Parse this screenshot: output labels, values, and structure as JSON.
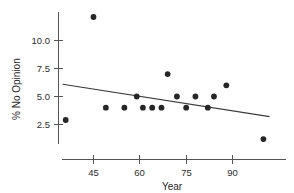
{
  "chart_data": {
    "type": "scatter",
    "title": "",
    "xlabel": "Year",
    "ylabel": "% No Opinion",
    "xlim": [
      34,
      104
    ],
    "ylim": [
      0.6,
      12.6
    ],
    "xticks": [
      45,
      60,
      75,
      90
    ],
    "xtick_labels": [
      "45",
      "60",
      "75",
      "90"
    ],
    "yticks": [
      2.5,
      5.0,
      7.5,
      10.0
    ],
    "ytick_labels": [
      "2.5",
      "5.0",
      "7.5",
      "10.0"
    ],
    "grid": false,
    "legend": null,
    "point_color": "#262626",
    "line_color": "#3a3a3a",
    "axis_color": "#555555",
    "x": [
      36,
      45,
      49,
      55,
      59,
      61,
      64,
      67,
      69,
      72,
      75,
      78,
      82,
      84,
      88,
      100
    ],
    "y": [
      2.9,
      12.1,
      4.0,
      4.0,
      5.0,
      4.0,
      4.0,
      4.0,
      7.0,
      5.0,
      4.0,
      5.0,
      4.0,
      5.0,
      6.0,
      1.2
    ],
    "points": [
      {
        "x": 36,
        "y": 2.9
      },
      {
        "x": 45,
        "y": 12.1
      },
      {
        "x": 49,
        "y": 4.0
      },
      {
        "x": 55,
        "y": 4.0
      },
      {
        "x": 59,
        "y": 5.0
      },
      {
        "x": 61,
        "y": 4.0
      },
      {
        "x": 64,
        "y": 4.0
      },
      {
        "x": 67,
        "y": 4.0
      },
      {
        "x": 69,
        "y": 7.0
      },
      {
        "x": 72,
        "y": 5.0
      },
      {
        "x": 75,
        "y": 4.0
      },
      {
        "x": 78,
        "y": 5.0
      },
      {
        "x": 82,
        "y": 4.0
      },
      {
        "x": 84,
        "y": 5.0
      },
      {
        "x": 88,
        "y": 6.0
      },
      {
        "x": 100,
        "y": 1.2
      }
    ],
    "trend_line": {
      "type": "linear-fit",
      "x_start": 35,
      "y_start": 6.1,
      "x_end": 102,
      "y_end": 3.2
    }
  }
}
